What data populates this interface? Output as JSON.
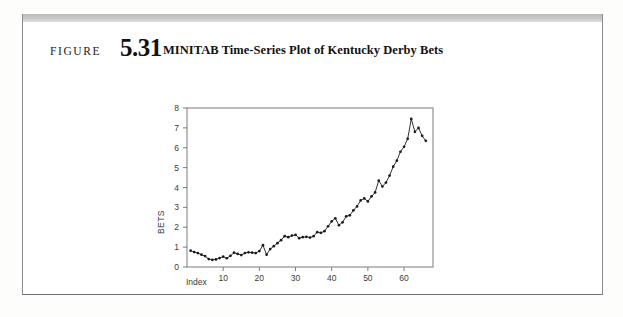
{
  "figure": {
    "label": "FIGURE",
    "number": "5.31",
    "title": "MINITAB Time-Series Plot of Kentucky Derby Bets"
  },
  "chart_data": {
    "type": "line",
    "title": "",
    "xlabel": "Index",
    "ylabel": "BETS",
    "xlim": [
      0,
      68
    ],
    "ylim": [
      0,
      8
    ],
    "xticks": [
      10,
      20,
      30,
      40,
      50,
      60
    ],
    "yticks": [
      0,
      1,
      2,
      3,
      4,
      5,
      6,
      7,
      8
    ],
    "grid": false,
    "legend": "none",
    "marker": "filled-circle",
    "line_color": "#1a1a1a",
    "x": [
      1,
      2,
      3,
      4,
      5,
      6,
      7,
      8,
      9,
      10,
      11,
      12,
      13,
      14,
      15,
      16,
      17,
      18,
      19,
      20,
      21,
      22,
      23,
      24,
      25,
      26,
      27,
      28,
      29,
      30,
      31,
      32,
      33,
      34,
      35,
      36,
      37,
      38,
      39,
      40,
      41,
      42,
      43,
      44,
      45,
      46,
      47,
      48,
      49,
      50,
      51,
      52,
      53,
      54,
      55,
      56,
      57,
      58,
      59,
      60,
      61,
      62,
      63,
      64,
      65,
      66
    ],
    "values": [
      0.82,
      0.75,
      0.7,
      0.62,
      0.55,
      0.4,
      0.36,
      0.38,
      0.45,
      0.52,
      0.44,
      0.56,
      0.72,
      0.66,
      0.6,
      0.7,
      0.74,
      0.72,
      0.7,
      0.8,
      1.1,
      0.62,
      0.9,
      1.05,
      1.2,
      1.35,
      1.55,
      1.5,
      1.58,
      1.62,
      1.45,
      1.5,
      1.52,
      1.48,
      1.55,
      1.75,
      1.72,
      1.8,
      2.05,
      2.3,
      2.45,
      2.1,
      2.25,
      2.55,
      2.6,
      2.85,
      3.05,
      3.35,
      3.45,
      3.3,
      3.55,
      3.75,
      4.35,
      4.05,
      4.25,
      4.6,
      5.05,
      5.35,
      5.8,
      6.05,
      6.45,
      7.45,
      6.8,
      7.0,
      6.6,
      6.35
    ]
  }
}
